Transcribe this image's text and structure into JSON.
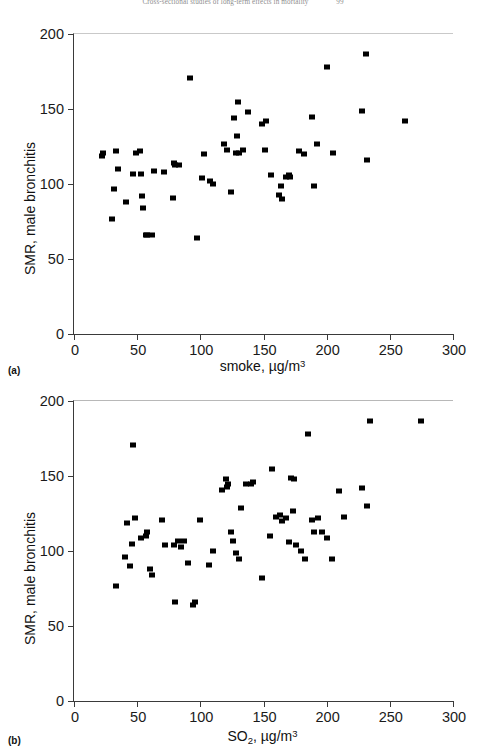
{
  "running_head": {
    "title": "Cross-sectional studies of long-term effects in mortality",
    "page": "99"
  },
  "figure": {
    "panels": [
      {
        "label": "(a)",
        "chart_key": 0
      },
      {
        "label": "(b)",
        "chart_key": 1
      }
    ]
  },
  "chart_data": [
    {
      "type": "scatter",
      "panel": "(a)",
      "title": "",
      "xlabel": "smoke, µg/m3",
      "xlabel_parts": {
        "lead": "smoke, µg/m",
        "sup": "3"
      },
      "ylabel": "SMR, male bronchitis",
      "xlim": [
        0,
        300
      ],
      "ylim": [
        0,
        200
      ],
      "xticks": [
        0,
        50,
        100,
        150,
        200,
        250,
        300
      ],
      "yticks": [
        0,
        50,
        100,
        150,
        200
      ],
      "grid": false,
      "legend": "none",
      "marker": "filled-square",
      "marker_color": "#000000",
      "points": [
        [
          22,
          119
        ],
        [
          23,
          121
        ],
        [
          30,
          77
        ],
        [
          32,
          97
        ],
        [
          33,
          122
        ],
        [
          35,
          110
        ],
        [
          41,
          88
        ],
        [
          47,
          107
        ],
        [
          49,
          121
        ],
        [
          52,
          122
        ],
        [
          53,
          107
        ],
        [
          54,
          92
        ],
        [
          55,
          84
        ],
        [
          57,
          66
        ],
        [
          58,
          66
        ],
        [
          62,
          66
        ],
        [
          63,
          109
        ],
        [
          71,
          108
        ],
        [
          78,
          91
        ],
        [
          79,
          114
        ],
        [
          80,
          113
        ],
        [
          83,
          113
        ],
        [
          92,
          171
        ],
        [
          97,
          64
        ],
        [
          101,
          104
        ],
        [
          103,
          120
        ],
        [
          108,
          102
        ],
        [
          110,
          100
        ],
        [
          119,
          127
        ],
        [
          121,
          123
        ],
        [
          124,
          95
        ],
        [
          127,
          144
        ],
        [
          128,
          121
        ],
        [
          129,
          132
        ],
        [
          130,
          155
        ],
        [
          131,
          121
        ],
        [
          134,
          123
        ],
        [
          138,
          148
        ],
        [
          149,
          140
        ],
        [
          151,
          123
        ],
        [
          152,
          142
        ],
        [
          156,
          106
        ],
        [
          162,
          93
        ],
        [
          164,
          99
        ],
        [
          165,
          90
        ],
        [
          168,
          105
        ],
        [
          170,
          106
        ],
        [
          171,
          105
        ],
        [
          178,
          122
        ],
        [
          182,
          120
        ],
        [
          188,
          145
        ],
        [
          190,
          99
        ],
        [
          192,
          127
        ],
        [
          200,
          178
        ],
        [
          205,
          121
        ],
        [
          228,
          149
        ],
        [
          231,
          187
        ],
        [
          232,
          116
        ],
        [
          262,
          142
        ]
      ]
    },
    {
      "type": "scatter",
      "panel": "(b)",
      "title": "",
      "xlabel": "SO2, µg/m3",
      "xlabel_parts": {
        "lead": "SO",
        "sub": "2",
        "mid": ", µg/m",
        "sup": "3"
      },
      "ylabel": "SMR, male bronchitis",
      "xlim": [
        0,
        300
      ],
      "ylim": [
        0,
        200
      ],
      "xticks": [
        0,
        50,
        100,
        150,
        200,
        250,
        300
      ],
      "yticks": [
        0,
        50,
        100,
        150,
        200
      ],
      "grid": false,
      "legend": false,
      "marker": "filled-square",
      "marker_color": "#000000",
      "points": [
        [
          33,
          77
        ],
        [
          40,
          96
        ],
        [
          42,
          119
        ],
        [
          44,
          90
        ],
        [
          46,
          105
        ],
        [
          47,
          171
        ],
        [
          48,
          122
        ],
        [
          53,
          109
        ],
        [
          57,
          110
        ],
        [
          58,
          113
        ],
        [
          60,
          88
        ],
        [
          62,
          84
        ],
        [
          70,
          121
        ],
        [
          72,
          104
        ],
        [
          79,
          104
        ],
        [
          80,
          66
        ],
        [
          82,
          107
        ],
        [
          85,
          103
        ],
        [
          87,
          107
        ],
        [
          90,
          92
        ],
        [
          94,
          64
        ],
        [
          96,
          66
        ],
        [
          100,
          121
        ],
        [
          107,
          91
        ],
        [
          110,
          100
        ],
        [
          117,
          141
        ],
        [
          120,
          148
        ],
        [
          121,
          143
        ],
        [
          122,
          145
        ],
        [
          124,
          113
        ],
        [
          126,
          107
        ],
        [
          128,
          99
        ],
        [
          131,
          95
        ],
        [
          132,
          129
        ],
        [
          136,
          145
        ],
        [
          140,
          145
        ],
        [
          142,
          146
        ],
        [
          149,
          82
        ],
        [
          155,
          110
        ],
        [
          157,
          155
        ],
        [
          160,
          123
        ],
        [
          163,
          124
        ],
        [
          165,
          120
        ],
        [
          168,
          122
        ],
        [
          170,
          106
        ],
        [
          172,
          149
        ],
        [
          173,
          127
        ],
        [
          174,
          148
        ],
        [
          176,
          104
        ],
        [
          180,
          100
        ],
        [
          183,
          95
        ],
        [
          185,
          178
        ],
        [
          188,
          121
        ],
        [
          190,
          113
        ],
        [
          193,
          122
        ],
        [
          196,
          113
        ],
        [
          200,
          109
        ],
        [
          204,
          95
        ],
        [
          210,
          140
        ],
        [
          214,
          123
        ],
        [
          228,
          142
        ],
        [
          232,
          130
        ],
        [
          234,
          187
        ],
        [
          275,
          187
        ]
      ]
    }
  ]
}
